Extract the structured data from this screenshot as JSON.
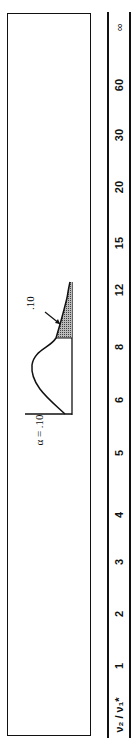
{
  "table": {
    "header_label": "ν₂ / ν₁*",
    "columns": [
      "1",
      "2",
      "3",
      "4",
      "5",
      "6",
      "8",
      "12",
      "15",
      "20",
      "30",
      "60",
      "∞"
    ]
  },
  "figure": {
    "alpha_label": "α = .10",
    "tail_label": ".10"
  }
}
